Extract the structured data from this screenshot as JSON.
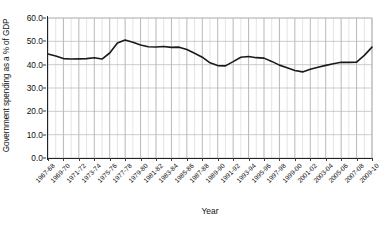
{
  "chart_data": {
    "type": "line",
    "title": "",
    "xlabel": "Year",
    "ylabel": "Government spending as a % of GDP",
    "ylim": [
      0.0,
      60.0
    ],
    "yticks": [
      0.0,
      10.0,
      20.0,
      30.0,
      40.0,
      50.0,
      60.0
    ],
    "ytick_labels": [
      "0.0",
      "10.0",
      "20.0",
      "30.0",
      "40.0",
      "50.0",
      "60.0"
    ],
    "grid": true,
    "grid_color": "#b8b8b8",
    "legend": "none",
    "line_color": "#1a1a1a",
    "line_width": 1.6,
    "x": [
      "1967-68",
      "1968-69",
      "1969-70",
      "1970-71",
      "1971-72",
      "1972-73",
      "1973-74",
      "1974-75",
      "1975-76",
      "1976-77",
      "1977-78",
      "1978-79",
      "1979-80",
      "1980-81",
      "1981-82",
      "1982-83",
      "1983-84",
      "1984-85",
      "1985-86",
      "1986-87",
      "1987-88",
      "1988-89",
      "1989-90",
      "1990-91",
      "1991-92",
      "1992-93",
      "1993-94",
      "1994-95",
      "1995-96",
      "1996-97",
      "1997-98",
      "1998-99",
      "1999-00",
      "2000-01",
      "2001-02",
      "2002-03",
      "2003-04",
      "2004-05",
      "2005-06",
      "2006-07",
      "2007-08",
      "2008-09",
      "2009-10"
    ],
    "xtick_labels": [
      "1967-68",
      "1969-70",
      "1971-72",
      "1973-74",
      "1975-76",
      "1977-78",
      "1979-80",
      "1981-82",
      "1983-84",
      "1985-86",
      "1987-88",
      "1989-90",
      "1991-92",
      "1993-94",
      "1995-96",
      "1997-98",
      "1999-00",
      "2001-02",
      "2003-04",
      "2005-06",
      "2007-08",
      "2009-10"
    ],
    "xtick_every": 2,
    "values": [
      44.6,
      43.7,
      42.6,
      42.4,
      42.5,
      42.6,
      43.0,
      42.4,
      45.0,
      49.3,
      50.6,
      49.6,
      48.4,
      47.7,
      47.6,
      47.8,
      47.4,
      47.5,
      46.5,
      44.9,
      43.2,
      40.8,
      39.6,
      39.5,
      41.3,
      43.2,
      43.5,
      43.0,
      42.8,
      41.4,
      39.8,
      38.7,
      37.5,
      36.9,
      38.0,
      38.9,
      39.7,
      40.4,
      41.0,
      41.0,
      41.1,
      44.0,
      47.5
    ]
  },
  "axis": {
    "y_title": "Government spending as a % of GDP",
    "x_title": "Year"
  }
}
